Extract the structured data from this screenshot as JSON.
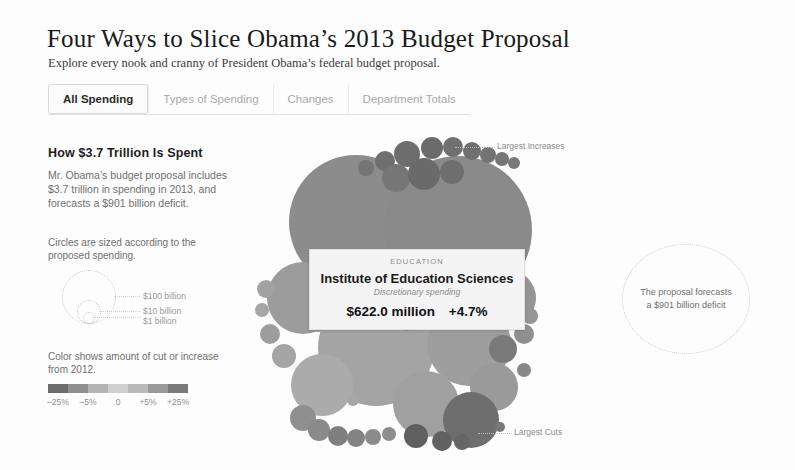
{
  "header": {
    "title": "Four Ways to Slice Obama’s 2013 Budget Proposal",
    "subtitle": "Explore every nook and cranny of President Obama’s federal budget proposal."
  },
  "tabs": [
    {
      "label": "All Spending",
      "active": true
    },
    {
      "label": "Types of Spending",
      "active": false
    },
    {
      "label": "Changes",
      "active": false
    },
    {
      "label": "Department Totals",
      "active": false
    }
  ],
  "panel": {
    "title": "How $3.7 Trillion Is Spent",
    "description": "Mr. Obama’s budget proposal includes $3.7 trillion in spending in 2013, and forecasts a $901 billion deficit."
  },
  "size_legend": {
    "caption": "Circles are sized according to the proposed spending.",
    "items": [
      {
        "label": "$100 billion"
      },
      {
        "label": "$10 billion"
      },
      {
        "label": "$1 billion"
      }
    ]
  },
  "color_legend": {
    "caption": "Color shows amount of cut or increase from 2012.",
    "ticks": [
      "–25%",
      "–5%",
      "0",
      "+5%",
      "+25%"
    ],
    "ramp": [
      "#6c6c6c",
      "#8f8f8f",
      "#b4b4b4",
      "#cfcfcf",
      "#b9b9b9",
      "#9a9a9a",
      "#7a7a7a"
    ]
  },
  "annotations": {
    "largest_increases": "Largest Increases",
    "largest_cuts": "Largest Cuts"
  },
  "tooltip": {
    "department": "EDUCATION",
    "program": "Institute of Education Sciences",
    "spending_type": "Discretionary spending",
    "amount": "$622.0 million",
    "change": "+4.7%"
  },
  "deficit_note": {
    "line1": "The proposal forecasts",
    "line2": "a $901 billion deficit"
  },
  "chart_data": {
    "type": "bubble",
    "title": "How $3.7 Trillion Is Spent",
    "size_encoding": "proposed spending (circle area)",
    "color_encoding": "percent change from 2012",
    "color_domain": [
      -25,
      -5,
      0,
      5,
      25
    ],
    "size_reference_values": [
      100000000000,
      10000000000,
      1000000000
    ],
    "total_spending": "$3.7 trillion",
    "deficit": "$901 billion",
    "year": 2013,
    "highlighted": {
      "department": "EDUCATION",
      "program": "Institute of Education Sciences",
      "spending_type": "Discretionary spending",
      "amount_usd": 622000000,
      "percent_change": 4.7
    },
    "bubbles": [
      {
        "cx": 100,
        "cy": 84,
        "r": 67,
        "fill": "#8c8c8c"
      },
      {
        "cx": 202,
        "cy": 92,
        "r": 74,
        "fill": "#8a8a8a"
      },
      {
        "cx": 120,
        "cy": 210,
        "r": 58,
        "fill": "#a4a4a4"
      },
      {
        "cx": 213,
        "cy": 206,
        "r": 42,
        "fill": "#9e9e9e"
      },
      {
        "cx": 47,
        "cy": 160,
        "r": 36,
        "fill": "#9c9c9c"
      },
      {
        "cx": 66,
        "cy": 247,
        "r": 31,
        "fill": "#ababab"
      },
      {
        "cx": 252,
        "cy": 160,
        "r": 28,
        "fill": "#959595"
      },
      {
        "cx": 170,
        "cy": 266,
        "r": 33,
        "fill": "#a0a0a0"
      },
      {
        "cx": 238,
        "cy": 249,
        "r": 24,
        "fill": "#9a9a9a"
      },
      {
        "cx": 215,
        "cy": 282,
        "r": 28,
        "fill": "#6e6e6e"
      },
      {
        "cx": 151,
        "cy": 16,
        "r": 13,
        "fill": "#6d6d6d"
      },
      {
        "cx": 176,
        "cy": 10,
        "r": 11,
        "fill": "#6b6b6b"
      },
      {
        "cx": 197,
        "cy": 9,
        "r": 10,
        "fill": "#707070"
      },
      {
        "cx": 216,
        "cy": 13,
        "r": 9,
        "fill": "#6f6f6f"
      },
      {
        "cx": 232,
        "cy": 17,
        "r": 8,
        "fill": "#737373"
      },
      {
        "cx": 246,
        "cy": 21,
        "r": 7,
        "fill": "#767676"
      },
      {
        "cx": 258,
        "cy": 25,
        "r": 6,
        "fill": "#787878"
      },
      {
        "cx": 129,
        "cy": 23,
        "r": 10,
        "fill": "#6f6f6f"
      },
      {
        "cx": 110,
        "cy": 30,
        "r": 8,
        "fill": "#747474"
      },
      {
        "cx": 140,
        "cy": 40,
        "r": 14,
        "fill": "#767676"
      },
      {
        "cx": 168,
        "cy": 36,
        "r": 16,
        "fill": "#6a6a6a"
      },
      {
        "cx": 196,
        "cy": 34,
        "r": 12,
        "fill": "#6e6e6e"
      },
      {
        "cx": 10,
        "cy": 151,
        "r": 9,
        "fill": "#a2a2a2"
      },
      {
        "cx": 6,
        "cy": 172,
        "r": 7,
        "fill": "#a6a6a6"
      },
      {
        "cx": 14,
        "cy": 196,
        "r": 10,
        "fill": "#9d9d9d"
      },
      {
        "cx": 28,
        "cy": 218,
        "r": 12,
        "fill": "#a4a4a4"
      },
      {
        "cx": 47,
        "cy": 280,
        "r": 13,
        "fill": "#8f8f8f"
      },
      {
        "cx": 63,
        "cy": 292,
        "r": 11,
        "fill": "#8a8a8a"
      },
      {
        "cx": 82,
        "cy": 298,
        "r": 10,
        "fill": "#7f7f7f"
      },
      {
        "cx": 100,
        "cy": 300,
        "r": 9,
        "fill": "#838383"
      },
      {
        "cx": 117,
        "cy": 299,
        "r": 8,
        "fill": "#8b8b8b"
      },
      {
        "cx": 133,
        "cy": 296,
        "r": 7,
        "fill": "#8d8d8d"
      },
      {
        "cx": 160,
        "cy": 298,
        "r": 12,
        "fill": "#5f5f5f"
      },
      {
        "cx": 186,
        "cy": 303,
        "r": 10,
        "fill": "#616161"
      },
      {
        "cx": 206,
        "cy": 304,
        "r": 8,
        "fill": "#666666"
      },
      {
        "cx": 247,
        "cy": 211,
        "r": 14,
        "fill": "#7a7a7a"
      },
      {
        "cx": 268,
        "cy": 196,
        "r": 10,
        "fill": "#8f8f8f"
      },
      {
        "cx": 274,
        "cy": 178,
        "r": 8,
        "fill": "#969696"
      },
      {
        "cx": 268,
        "cy": 232,
        "r": 7,
        "fill": "#888888"
      },
      {
        "cx": 150,
        "cy": 186,
        "r": 7,
        "fill": "#8b8b8b"
      },
      {
        "cx": 166,
        "cy": 184,
        "r": 6,
        "fill": "#909090"
      },
      {
        "cx": 62,
        "cy": 188,
        "r": 6,
        "fill": "#9a9a9a"
      },
      {
        "cx": 244,
        "cy": 289,
        "r": 5,
        "fill": "#777777"
      },
      {
        "cx": 97,
        "cy": 262,
        "r": 6,
        "fill": "#a6a6a6"
      },
      {
        "cx": 120,
        "cy": 170,
        "r": 5,
        "fill": "#939393"
      }
    ]
  }
}
